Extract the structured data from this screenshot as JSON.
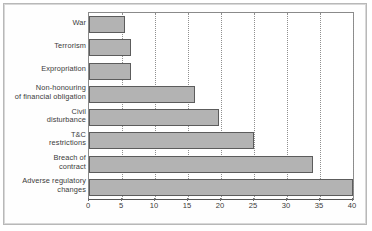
{
  "chart_data": {
    "type": "bar",
    "orientation": "horizontal",
    "title": "",
    "xlabel": "",
    "ylabel": "",
    "categories": [
      "War",
      "Terrorism",
      "Expropriation",
      "Non-honouring\nof financial obligation",
      "Civil\ndisturbance",
      "T&C\nrestrictions",
      "Breach of\ncontract",
      "Adverse regulatory\nchanges"
    ],
    "category_lines": [
      [
        "War"
      ],
      [
        "Terrorism"
      ],
      [
        "Expropriation"
      ],
      [
        "Non-honouring",
        "of financial obligation"
      ],
      [
        "Civil",
        "disturbance"
      ],
      [
        "T&C",
        "restrictions"
      ],
      [
        "Breach of",
        "contract"
      ],
      [
        "Adverse regulatory",
        "changes"
      ]
    ],
    "values": [
      5.4,
      6.3,
      6.3,
      16,
      19.7,
      25,
      34,
      40
    ],
    "xlim": [
      0,
      40
    ],
    "xticks": [
      0,
      5,
      10,
      15,
      20,
      25,
      30,
      35,
      40
    ],
    "xtick_labels": [
      "0",
      "5",
      "10",
      "15",
      "20",
      "25",
      "30",
      "35",
      "40"
    ],
    "grid": "vertical-dotted",
    "legend": "none",
    "bar_fill_color": "#b3b3b3",
    "bar_border_color": "#5c5c5c",
    "grid_color": "#8f8f8f",
    "axis_color": "#555555",
    "text_color": "#3a3a3a"
  }
}
